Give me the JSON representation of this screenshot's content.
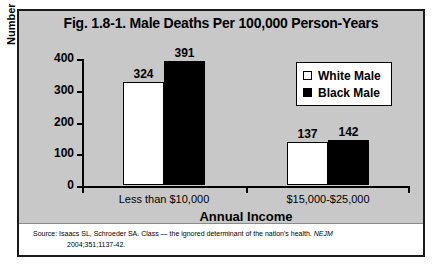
{
  "figure": {
    "title": "Fig. 1.8-1. Male Deaths Per 100,000 Person-Years",
    "source_line_1_prefix": "Source: Isaacs SL, Schroeder SA. Class — the ignored determinant of the nation's health. ",
    "source_journal": "NEJM",
    "source_line_2": "2004;351;1137-42."
  },
  "legend": {
    "items": [
      {
        "label": "White Male",
        "swatch": "white-square-icon",
        "color": "#ffffff"
      },
      {
        "label": "Black Male",
        "swatch": "black-square-icon",
        "color": "#000000"
      }
    ]
  },
  "chart_data": {
    "type": "bar",
    "title": "Fig. 1.8-1. Male Deaths Per 100,000 Person-Years",
    "xlabel": "Annual Income",
    "ylabel": "Number of Male Deaths",
    "categories": [
      "Less than $10,000",
      "$15,000-$25,000"
    ],
    "series": [
      {
        "name": "White Male",
        "color": "#ffffff",
        "values": [
          324,
          137
        ]
      },
      {
        "name": "Black Male",
        "color": "#000000",
        "values": [
          391,
          142
        ]
      }
    ],
    "ylim": [
      0,
      400
    ],
    "yticks": [
      0,
      100,
      200,
      300,
      400
    ],
    "ytick_labels": [
      "0",
      "100",
      "200",
      "300",
      "400"
    ],
    "grid": false,
    "legend_position": "top-right",
    "data_labels": true
  }
}
